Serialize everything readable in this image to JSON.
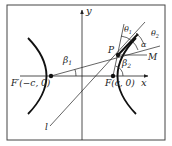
{
  "figure": {
    "labels": {
      "y_axis": "y",
      "x_axis": "x",
      "left_focus": "F′(−c, 0)",
      "right_focus": "F(c, 0)",
      "point_p": "P",
      "point_m": "M",
      "line_l": "l",
      "beta1": "β",
      "beta1_sub": "1",
      "beta2": "β",
      "beta2_sub": "2",
      "theta1": "θ",
      "theta1_sub": "1",
      "theta2": "θ",
      "theta2_sub": "2",
      "alpha": "α"
    },
    "colors": {
      "stroke": "#222222",
      "frame": "#444444",
      "background": "#ffffff"
    }
  }
}
